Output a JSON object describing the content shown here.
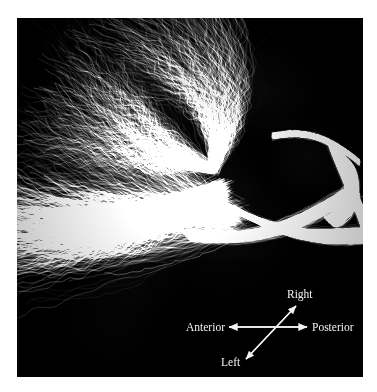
{
  "figure": {
    "domain": "scientific-visualization",
    "kind": "dti-tractography",
    "background_color": "#ffffff",
    "panel_color": "#000000",
    "panel": {
      "x": 17,
      "y": 18,
      "width": 346,
      "height": 359
    }
  },
  "chart_data": {
    "type": "scatter",
    "title": "",
    "xlabel": "",
    "ylabel": "",
    "rendering": "white-matter fiber tractography streamlines rendered in grayscale on a black background",
    "view": "axial / superior view of corpus callosum and projection fibers",
    "colormap": "grayscale",
    "streamline_color_low": "#1a1a1a",
    "streamline_color_high": "#d8d8d8",
    "structures": [
      {
        "name": "anterior-fan",
        "description": "broad fan of streamlines spreading toward the anterior-left region",
        "brightness": 0.55
      },
      {
        "name": "central-trunk",
        "description": "dense bright bundle running diagonally through the middle of the field",
        "brightness": 0.85
      },
      {
        "name": "posterior-hook",
        "description": "bright curved bundle forming a hook in the upper right, bending back toward posterior",
        "brightness": 0.9
      },
      {
        "name": "inferior-fan",
        "description": "streamlines radiating downward-left in the lower portion",
        "brightness": 0.45
      }
    ]
  },
  "orientation": {
    "name": "orientation-compass",
    "origin": {
      "x": 251,
      "y": 309
    },
    "axes": [
      {
        "id": "anterior-posterior",
        "style": "double-headed-horizontal-arrow",
        "negative_label": "Anterior",
        "positive_label": "Posterior",
        "color": "#f4f2ee"
      },
      {
        "id": "left-right",
        "style": "double-headed-diagonal-arrow",
        "negative_label": "Left",
        "positive_label": "Right",
        "color": "#f4f2ee"
      }
    ],
    "labels": {
      "right": "Right",
      "left": "Left",
      "anterior": "Anterior",
      "posterior": "Posterior"
    }
  }
}
